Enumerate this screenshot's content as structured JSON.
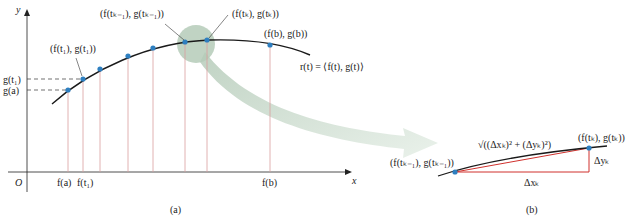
{
  "panel_a": {
    "caption": "(a)",
    "axes": {
      "x_label": "x",
      "y_label": "y",
      "origin_label": "O"
    },
    "curve_label": "r(t) = ⟨f(t), g(t)⟩",
    "point_labels": {
      "t1": "(f(t₁), g(t₁))",
      "tk_minus_1": "(f(tₖ₋₁), g(tₖ₋₁))",
      "tk": "(f(tₖ), g(tₖ))",
      "b": "(f(b), g(b))"
    },
    "y_ticks": [
      "g(t₁)",
      "g(a)"
    ],
    "x_ticks": [
      "f(a)",
      "f(t₁)",
      "f(b)"
    ]
  },
  "panel_b": {
    "caption": "(b)",
    "left_point": "(f(tₖ₋₁), g(tₖ₋₁))",
    "right_point": "(f(tₖ), g(tₖ))",
    "hypotenuse": "√((Δxₖ)² + (Δyₖ)²)",
    "dx": "Δxₖ",
    "dy": "Δyₖ"
  },
  "colors": {
    "curve": "#1a1a1a",
    "point": "#2e7fc0",
    "drop_line": "#d9a0a0",
    "triangle": "#d0312d",
    "highlight": "#b9cfc0",
    "arrow": "#dbe8dd"
  }
}
